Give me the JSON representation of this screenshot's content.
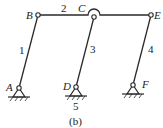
{
  "diagram": {
    "type": "planar-linkage-mechanism",
    "caption": "(b)",
    "colors": {
      "line": "#2a2a2a",
      "background": "#ffffff",
      "text": "#222222"
    },
    "joints": [
      {
        "id": "A",
        "label": "A",
        "kind": "ground-pivot",
        "x": 19,
        "y": 88
      },
      {
        "id": "B",
        "label": "B",
        "kind": "revolute",
        "x": 38,
        "y": 15
      },
      {
        "id": "C",
        "label": "C",
        "kind": "revolute-crossover",
        "x": 94,
        "y": 17
      },
      {
        "id": "D",
        "label": "D",
        "kind": "ground-pivot",
        "x": 76,
        "y": 87
      },
      {
        "id": "E",
        "label": "E",
        "kind": "revolute",
        "x": 151,
        "y": 15
      },
      {
        "id": "F",
        "label": "F",
        "kind": "ground-pivot",
        "x": 133,
        "y": 85
      }
    ],
    "links": [
      {
        "id": "1",
        "label": "1",
        "from": "A",
        "to": "B"
      },
      {
        "id": "2",
        "label": "2",
        "from": "B",
        "to": "E"
      },
      {
        "id": "3",
        "label": "3",
        "from": "C",
        "to": "D"
      },
      {
        "id": "4",
        "label": "4",
        "from": "E",
        "to": "F"
      },
      {
        "id": "5",
        "label": "5",
        "kind": "ground"
      }
    ]
  }
}
